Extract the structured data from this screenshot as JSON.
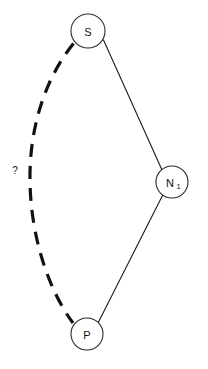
{
  "diagram": {
    "type": "graph",
    "background_color": "#ffffff",
    "stroke_color": "#111111",
    "width": 208,
    "height": 369,
    "nodes": [
      {
        "id": "S",
        "label": "S",
        "subscript": "",
        "cx": 88,
        "cy": 31,
        "r": 17
      },
      {
        "id": "N1",
        "label": "N",
        "subscript": "1",
        "cx": 172,
        "cy": 182,
        "r": 16
      },
      {
        "id": "P",
        "label": "P",
        "subscript": "",
        "cx": 87,
        "cy": 334,
        "r": 16
      }
    ],
    "edges": [
      {
        "id": "s-n1",
        "from": "S",
        "to": "N1",
        "style": "solid",
        "label": ""
      },
      {
        "id": "n1-p",
        "from": "N1",
        "to": "P",
        "style": "solid",
        "label": ""
      },
      {
        "id": "s-p",
        "from": "S",
        "to": "P",
        "style": "dashed",
        "curved": true,
        "label": "?"
      }
    ],
    "labels": {
      "unknown_edge": "?"
    }
  }
}
